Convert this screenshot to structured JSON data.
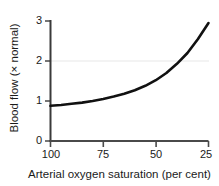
{
  "chart_data": {
    "type": "line",
    "title": "",
    "xlabel": "Arterial oxygen saturation (per cent)",
    "ylabel": "Blood flow (× normal)",
    "xlim": [
      100,
      25
    ],
    "ylim": [
      0,
      3
    ],
    "x_ticks": [
      "100",
      "75",
      "50",
      "25"
    ],
    "x_tick_values": [
      100,
      75,
      50,
      25
    ],
    "y_ticks": [
      "0",
      "1",
      "2",
      "3"
    ],
    "y_tick_values": [
      0,
      1,
      2,
      3
    ],
    "x_axis_inverted": true,
    "grid": "faint horizontal gridline at y = 2",
    "legend": "none",
    "series": [
      {
        "name": "Blood flow",
        "color": "#111111",
        "x": [
          100,
          95,
          90,
          85,
          80,
          75,
          70,
          65,
          60,
          55,
          50,
          45,
          40,
          35,
          30,
          25
        ],
        "values": [
          0.88,
          0.9,
          0.93,
          0.96,
          1.0,
          1.05,
          1.11,
          1.18,
          1.27,
          1.38,
          1.52,
          1.7,
          1.93,
          2.2,
          2.55,
          2.95
        ]
      }
    ]
  },
  "axis": {
    "y_label_text": "Blood flow (× normal)",
    "x_label_text": "Arterial oxygen saturation (per cent)",
    "y_tick_0": "0",
    "y_tick_1": "1",
    "y_tick_2": "2",
    "y_tick_3": "3",
    "x_tick_0": "100",
    "x_tick_1": "75",
    "x_tick_2": "50",
    "x_tick_3": "25"
  },
  "colors": {
    "curve": "#111111",
    "axis": "#3a3a3a",
    "gridline": "#efefef",
    "background": "#ffffff",
    "text": "#1a1a1a"
  }
}
